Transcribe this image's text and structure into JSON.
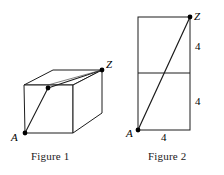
{
  "figure1": {
    "caption": "Figure 1",
    "shape": "cube",
    "vertex_labels": {
      "A": "A",
      "Z": "Z"
    },
    "points": [
      {
        "name": "A",
        "x": 25,
        "y": 133
      },
      {
        "name": "midpoint",
        "x": 48,
        "y": 88
      },
      {
        "name": "Z",
        "x": 102,
        "y": 70
      }
    ],
    "geometry": {
      "front_top_left": {
        "x": 24,
        "y": 85
      },
      "front_top_right": {
        "x": 73,
        "y": 85
      },
      "front_bottom_left": {
        "x": 25,
        "y": 133
      },
      "front_bottom_right": {
        "x": 73,
        "y": 133
      },
      "back_top_left": {
        "x": 53,
        "y": 70
      },
      "back_top_right": {
        "x": 102,
        "y": 70
      },
      "back_bottom_right": {
        "x": 102,
        "y": 113
      }
    }
  },
  "figure2": {
    "caption": "Figure 2",
    "shape": "rectangle-split",
    "vertex_labels": {
      "A": "A",
      "Z": "Z"
    },
    "dimension_labels": {
      "right_top": "4",
      "right_bottom": "4",
      "bottom": "4"
    },
    "points": [
      {
        "name": "A",
        "x": 138,
        "y": 130
      },
      {
        "name": "Z",
        "x": 190,
        "y": 17
      }
    ],
    "geometry": {
      "top_left": {
        "x": 138,
        "y": 17
      },
      "top_right": {
        "x": 190,
        "y": 17
      },
      "bottom_left": {
        "x": 138,
        "y": 130
      },
      "bottom_right": {
        "x": 190,
        "y": 130
      },
      "mid_left": {
        "x": 138,
        "y": 73
      },
      "mid_right": {
        "x": 190,
        "y": 73
      }
    }
  },
  "style": {
    "stroke": "#1c1c1c",
    "stroke_light": "#3a3a3a",
    "background": "#ffffff",
    "dot_fill": "#000000"
  }
}
